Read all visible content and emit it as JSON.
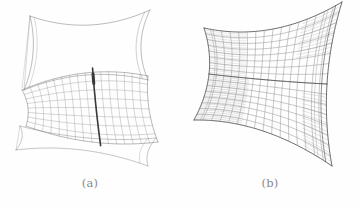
{
  "figure": {
    "background_color": "#fefefe",
    "ink_color": "#8e8e8e",
    "ink_color_dark": "#4a4a4a",
    "highlight_color": "#3a3a3a",
    "panels": [
      {
        "id": "a",
        "caption": "(a)",
        "description": "wireframe surface with boundary outline and a partially meshed band carrying a highlighted geodesic curve",
        "mesh_style": "sparse",
        "has_highlight_curve": true
      },
      {
        "id": "b",
        "caption": "(b)",
        "description": "same surface rendered as a dense quadrilateral wireframe mesh over the entire patch",
        "mesh_style": "dense",
        "has_highlight_curve": false
      }
    ]
  },
  "chart_data": {
    "type": "line",
    "title": "",
    "subtitle": "",
    "xlabel": "",
    "ylabel": "",
    "grid": true,
    "legend": "none",
    "panels": [
      {
        "label": "(a)",
        "kind": "wireframe-surface",
        "u_divisions": 16,
        "v_divisions": 8,
        "meshed_band_v_range": [
          4,
          8
        ],
        "outline_only_v_range": [
          0,
          4
        ],
        "highlight_curve": {
          "name": "geodesic",
          "u_index": 9,
          "color": "#3a3a3a",
          "width": 1.6
        },
        "corners_px": [
          [
            26,
            14
          ],
          [
            150,
            10
          ],
          [
            158,
            148
          ],
          [
            20,
            132
          ]
        ]
      },
      {
        "label": "(b)",
        "kind": "wireframe-surface",
        "u_divisions": 16,
        "v_divisions": 16,
        "meshed_band_v_range": [
          0,
          16
        ],
        "outline_only_v_range": [],
        "highlight_curve": null,
        "corners_px": [
          [
            24,
            22
          ],
          [
            162,
            8
          ],
          [
            152,
            160
          ],
          [
            14,
            126
          ]
        ]
      }
    ]
  }
}
